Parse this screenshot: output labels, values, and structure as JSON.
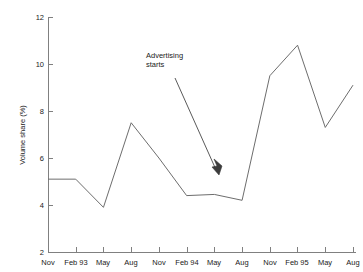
{
  "chart_data": {
    "type": "line",
    "title": "",
    "subtitle": "",
    "xlabel": "",
    "ylabel": "Volume share (%)",
    "categories": [
      "Nov",
      "Feb 93",
      "May",
      "Aug",
      "Nov",
      "Feb 94",
      "May",
      "Aug",
      "Nov",
      "Feb 95",
      "May",
      "Aug"
    ],
    "values": [
      5.1,
      5.1,
      3.9,
      7.5,
      6.0,
      4.4,
      4.45,
      4.2,
      9.5,
      10.8,
      7.3,
      9.1
    ],
    "series": [
      {
        "name": "Volume share",
        "values": [
          5.1,
          5.1,
          3.9,
          7.5,
          6.0,
          4.4,
          4.45,
          4.2,
          9.5,
          10.8,
          7.3,
          9.1
        ],
        "color": "#6d6d6d"
      }
    ],
    "ylim": [
      2,
      12
    ],
    "ytick_labels": [
      "12",
      "10",
      "8",
      "6",
      "4",
      "2"
    ],
    "ytick_values": [
      12,
      10,
      8,
      6,
      4,
      2
    ],
    "xtick_labels": [
      "Nov",
      "Feb 93",
      "May",
      "Aug",
      "Nov",
      "Feb 94",
      "May",
      "Aug",
      "Nov",
      "Feb 95",
      "May",
      "Aug"
    ],
    "grid": false,
    "legend": false,
    "legend_position": "none",
    "annotations": [
      {
        "text_line_1": "Advertising",
        "text_line_2": "starts",
        "text_x": 146,
        "text_y": 55,
        "arrow_from_x": 175,
        "arrow_from_y": 78,
        "arrow_to_x": 219,
        "arrow_to_y": 174,
        "points_to_category": "May 94"
      }
    ],
    "colors": {
      "series_line": "#6d6d6d",
      "axis": "#808080",
      "text": "#1a1a1a",
      "annotation": "#3c3c3c",
      "background": "#ffffff"
    }
  },
  "axis_title_y": "Volume share (%)",
  "annotation_line_1": "Advertising",
  "annotation_line_2": "starts"
}
